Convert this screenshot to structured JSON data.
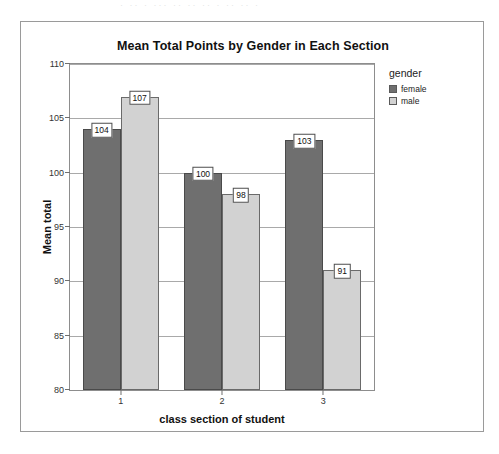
{
  "page": {
    "artifact_text": "· ·· ·  ··· ·· ·· ·· ·  ·· ·· ·"
  },
  "legend": {
    "title": "gender",
    "entries": [
      {
        "label": "female",
        "color": "#6f6f6f"
      },
      {
        "label": "male",
        "color": "#d2d2d2"
      }
    ]
  },
  "chart_data": {
    "type": "bar",
    "title": "Mean Total Points by Gender in Each Section",
    "xlabel": "class section of student",
    "ylabel": "Mean total",
    "categories": [
      "1",
      "2",
      "3"
    ],
    "series": [
      {
        "name": "female",
        "color": "#6f6f6f",
        "values": [
          104,
          100,
          103
        ]
      },
      {
        "name": "male",
        "color": "#d2d2d2",
        "values": [
          107,
          98,
          91
        ]
      }
    ],
    "ylim": [
      80,
      110
    ],
    "yticks": [
      80,
      85,
      90,
      95,
      100,
      105,
      110
    ],
    "ytick_labels": [
      "80",
      "85",
      "90",
      "95",
      "100",
      "105",
      "110"
    ],
    "grid": true,
    "legend_position": "right",
    "data_labels": true
  }
}
